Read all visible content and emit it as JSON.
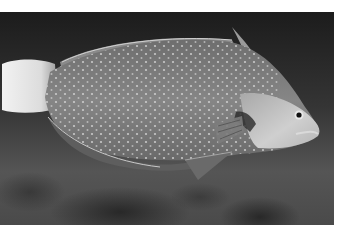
{
  "image": {
    "subject": "Wrasse fish swimming left-to-right (head at right) over a dark, blurred reef background",
    "style": "grayscale photograph",
    "alt": "Grayscale photo of a spotted wrasse fish with a pale tail and light-colored head"
  },
  "colors": {
    "background_top": "#1e1e1e",
    "background_bottom": "#5a5a5a",
    "body": "#7a7a7a",
    "head": "#c4c4c4",
    "tail": "#e6e6e6",
    "spots": "#d8d8d8",
    "margin": "#ffffff"
  }
}
